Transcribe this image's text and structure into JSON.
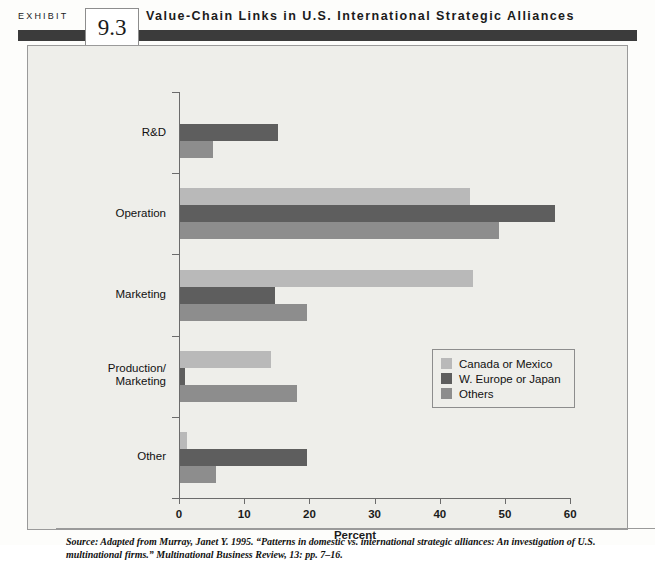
{
  "header": {
    "exhibit_label": "EXHIBIT",
    "exhibit_number": "9.3",
    "title": "Value-Chain Links in U.S. International Strategic Alliances"
  },
  "legend": {
    "items": [
      {
        "label": "Canada or Mexico",
        "color": "#b9b9b9"
      },
      {
        "label": "W. Europe or Japan",
        "color": "#5e5e5e"
      },
      {
        "label": "Others",
        "color": "#8d8d8d"
      }
    ]
  },
  "source": {
    "line1": "Source: Adapted from Murray, Janet Y. 1995. “Patterns in domestic vs. international strategic alliances: An investigation of U.S. multinational",
    "line2": "firms.” Multinational Business Review, 13: pp. 7–16."
  },
  "chart_data": {
    "type": "bar",
    "orientation": "horizontal",
    "title": "Value-Chain Links in U.S. International Strategic Alliances",
    "xlabel": "Percent",
    "ylabel": "",
    "xlim": [
      0,
      60
    ],
    "xticks": [
      0,
      10,
      20,
      30,
      40,
      50,
      60
    ],
    "grid": false,
    "legend_position": "center-right",
    "categories": [
      "R&D",
      "Operation",
      "Marketing",
      "Production/\nMarketing",
      "Other"
    ],
    "series": [
      {
        "name": "Canada or Mexico",
        "color": "#b9b9b9",
        "values": [
          0,
          44.5,
          45,
          14,
          1
        ]
      },
      {
        "name": "W. Europe or Japan",
        "color": "#5e5e5e",
        "values": [
          15,
          57.5,
          14.5,
          0.7,
          19.5
        ]
      },
      {
        "name": "Others",
        "color": "#8d8d8d",
        "values": [
          5,
          49,
          19.5,
          18,
          5.5
        ]
      }
    ]
  }
}
